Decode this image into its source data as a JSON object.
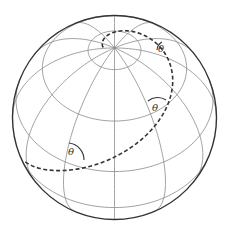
{
  "diagram": {
    "angle_labels": [
      "θ",
      "θ",
      "θ"
    ],
    "colors": {
      "outline": "#333333",
      "grid": "#8a8a8a",
      "loxodrome": "#333333",
      "background": "#ffffff"
    },
    "sphere": {
      "cx": 114.5,
      "cy": 117.5,
      "r": 102,
      "tilt_deg": 47
    },
    "latitudes_deg": [
      75,
      45,
      15,
      -15,
      -45
    ],
    "meridian_step_deg": 30,
    "loxodrome": {
      "bearing_deg": 62,
      "start_lat_deg": -8,
      "start_lon_deg": -62,
      "end_lat_deg": 84
    },
    "angle_marks": [
      {
        "x": 79,
        "y": 160,
        "r": 10
      },
      {
        "x": 163,
        "y": 101,
        "r": 10
      },
      {
        "x": 162,
        "y": 47,
        "r": 7
      }
    ]
  }
}
